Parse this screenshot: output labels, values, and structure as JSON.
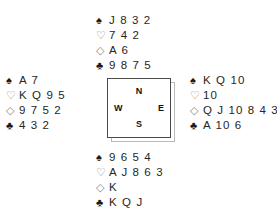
{
  "diagram": {
    "type": "bridge-deal-diagram",
    "suits": [
      {
        "key": "spades",
        "glyph": "♠",
        "name": "spade-symbol",
        "fill": "black"
      },
      {
        "key": "hearts",
        "glyph": "♡",
        "name": "heart-symbol",
        "fill": "white"
      },
      {
        "key": "diamonds",
        "glyph": "◇",
        "name": "diamond-symbol",
        "fill": "white"
      },
      {
        "key": "clubs",
        "glyph": "♣",
        "name": "club-symbol",
        "fill": "black"
      }
    ],
    "hands": {
      "north": {
        "label": "North",
        "spades": "J 8 3 2",
        "hearts": "7 4 2",
        "diamonds": "A 6",
        "clubs": "9 8 7 5"
      },
      "west": {
        "label": "West",
        "spades": "A 7",
        "hearts": "K Q 9 5",
        "diamonds": "9 7 5 2",
        "clubs": "4 3 2"
      },
      "east": {
        "label": "East",
        "spades": "K Q 10",
        "hearts": "10",
        "diamonds": "Q J 10 8 4 3",
        "clubs": "A 10 6"
      },
      "south": {
        "label": "South",
        "spades": "9 6 5 4",
        "hearts": "A J 8 6 3",
        "diamonds": "K",
        "clubs": "K Q J"
      }
    },
    "compass": {
      "north": "N",
      "south": "S",
      "west": "W",
      "east": "E"
    },
    "colors": {
      "text": "#1b1b1b",
      "outline_suit": "#8a8a8a",
      "box_border": "#4a4a4a",
      "box_shadow": "#b9b9b9",
      "background": "#ffffff"
    }
  }
}
